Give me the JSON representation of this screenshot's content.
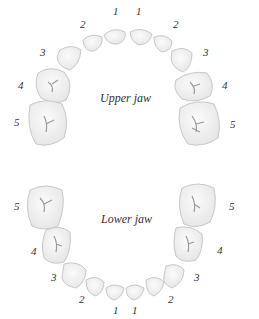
{
  "upper": {
    "label": "Upper jaw",
    "numbers": [
      {
        "text": "1",
        "x": 113,
        "y": 6
      },
      {
        "text": "1",
        "x": 136,
        "y": 6
      },
      {
        "text": "2",
        "x": 80,
        "y": 19
      },
      {
        "text": "2",
        "x": 173,
        "y": 19
      },
      {
        "text": "3",
        "x": 40,
        "y": 47
      },
      {
        "text": "3",
        "x": 203,
        "y": 47
      },
      {
        "text": "4",
        "x": 18,
        "y": 80
      },
      {
        "text": "4",
        "x": 222,
        "y": 80
      },
      {
        "text": "5",
        "x": 14,
        "y": 117
      },
      {
        "text": "5",
        "x": 230,
        "y": 119
      }
    ]
  },
  "lower": {
    "label": "Lower jaw",
    "numbers": [
      {
        "text": "5",
        "x": 14,
        "y": 201
      },
      {
        "text": "5",
        "x": 229,
        "y": 201
      },
      {
        "text": "4",
        "x": 31,
        "y": 246
      },
      {
        "text": "4",
        "x": 217,
        "y": 245
      },
      {
        "text": "3",
        "x": 51,
        "y": 272
      },
      {
        "text": "3",
        "x": 194,
        "y": 272
      },
      {
        "text": "2",
        "x": 79,
        "y": 294
      },
      {
        "text": "2",
        "x": 168,
        "y": 294
      },
      {
        "text": "1",
        "x": 113,
        "y": 305
      },
      {
        "text": "1",
        "x": 132,
        "y": 305
      }
    ]
  },
  "colors": {
    "tooth_fill": "#f2f2f2",
    "tooth_stroke": "#c8c8c8",
    "groove": "#9a9a9a",
    "text": "#333333"
  }
}
